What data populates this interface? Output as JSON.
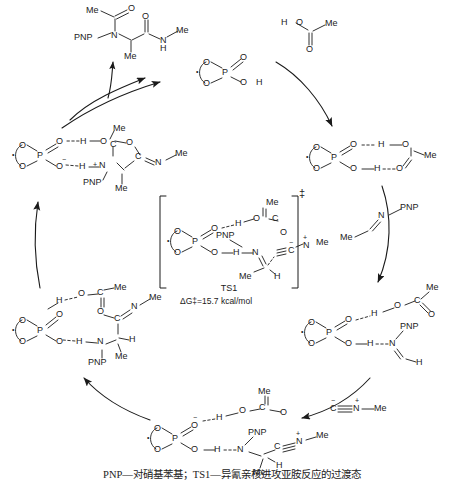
{
  "diagram": {
    "type": "catalytic-cycle",
    "caption": "PNP—对硝基苯基；TS1—异氰亲核进攻亚胺反应的过渡态",
    "transition_state": {
      "name": "TS1",
      "energy": "ΔG‡=15.7 kcal/mol",
      "dagger": "‡"
    },
    "atoms": {
      "P": "P",
      "O": "O",
      "N": "N",
      "C": "C",
      "H": "H",
      "Me": "Me",
      "PNP": "PNP"
    },
    "charges": {
      "minus": "−",
      "plus": "+"
    }
  },
  "species": {
    "product": {
      "name": "ugi-product",
      "labels": [
        "Me",
        "O",
        "O",
        "PNP",
        "N",
        "Me",
        "N",
        "H",
        "Me",
        "Me"
      ]
    },
    "catalyst": {
      "name": "chiral-phosphoric-acid",
      "labels": [
        "O",
        "O",
        "P",
        "O",
        "O",
        "H"
      ]
    },
    "acetic_acid": {
      "name": "acetic-acid",
      "labels": [
        "H",
        "O",
        "O",
        "Me"
      ]
    },
    "imine": {
      "name": "n-pnp-acetaldimine",
      "labels": [
        "N",
        "PNP",
        "Me"
      ]
    },
    "isocyanide": {
      "name": "methyl-isocyanide",
      "labels": [
        "C",
        "N",
        "Me"
      ]
    },
    "complex_acid": {
      "name": "catalyst-acetic-acid-complex",
      "labels": [
        "O",
        "O",
        "P",
        "O",
        "O",
        "H",
        "H",
        "O",
        "O",
        "Me"
      ]
    },
    "complex_iminium": {
      "name": "iminium-ion-pair",
      "labels": [
        "O",
        "O",
        "P",
        "O",
        "O",
        "H",
        "H",
        "O",
        "C",
        "O",
        "Me",
        "N",
        "PNP",
        "H"
      ]
    },
    "nitrilium": {
      "name": "nitrilium-intermediate",
      "labels": [
        "O",
        "O",
        "P",
        "O",
        "O",
        "H",
        "H",
        "O",
        "C",
        "O",
        "Me",
        "N",
        "PNP",
        "C",
        "N",
        "Me",
        "Me",
        "H"
      ]
    },
    "imidate": {
      "name": "imidate-intermediate",
      "labels": [
        "O",
        "O",
        "P",
        "O",
        "O",
        "H",
        "H",
        "O",
        "C",
        "Me",
        "O",
        "C",
        "N",
        "Me",
        "N",
        "PNP",
        "H",
        "Me"
      ]
    },
    "oxazolinium": {
      "name": "cyclic-oxazolinium-intermediate",
      "labels": [
        "O",
        "O",
        "P",
        "O",
        "O",
        "H",
        "H",
        "O",
        "C",
        "Me",
        "O",
        "C",
        "N",
        "Me",
        "N",
        "PNP",
        "H",
        "Me"
      ]
    }
  }
}
